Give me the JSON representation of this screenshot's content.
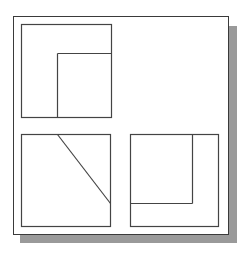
{
  "diagram": {
    "type": "orthographic-three-view",
    "frame": {
      "x": 13,
      "y": 16,
      "width": 215,
      "height": 218,
      "stroke": "#3a3a3a",
      "shadow_color": "#9a9a9a"
    },
    "views": [
      {
        "name": "top-view",
        "outline": {
          "x": 21,
          "y": 24,
          "width": 90,
          "height": 93
        },
        "lines": [
          {
            "x1": 57,
            "y1": 53,
            "x2": 111,
            "y2": 53
          },
          {
            "x1": 57,
            "y1": 53,
            "x2": 57,
            "y2": 117
          }
        ]
      },
      {
        "name": "front-view",
        "outline": {
          "x": 21,
          "y": 134,
          "width": 89,
          "height": 92
        },
        "lines": [
          {
            "x1": 57,
            "y1": 134,
            "x2": 110,
            "y2": 203
          }
        ]
      },
      {
        "name": "side-view",
        "outline": {
          "x": 130,
          "y": 134,
          "width": 88,
          "height": 92
        },
        "lines": [
          {
            "x1": 192,
            "y1": 134,
            "x2": 192,
            "y2": 203
          },
          {
            "x1": 130,
            "y1": 203,
            "x2": 192,
            "y2": 203
          }
        ]
      }
    ],
    "line_color": "#444444"
  }
}
